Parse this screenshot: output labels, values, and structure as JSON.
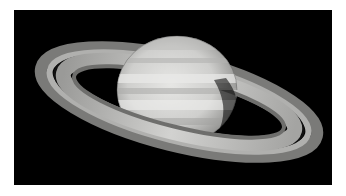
{
  "image": {
    "subject": "Saturn with its ring system",
    "description": "Photograph of the planet Saturn against a black background; tilted ring system with visible Cassini division, banded cream-gray globe",
    "colors": {
      "background": "#000000",
      "border": "#ffffff",
      "globe": "#d4d4d2",
      "ring_outer": "#8a8a8a",
      "ring_inner": "#c8c8c6",
      "cassini_division": "#141414"
    }
  }
}
